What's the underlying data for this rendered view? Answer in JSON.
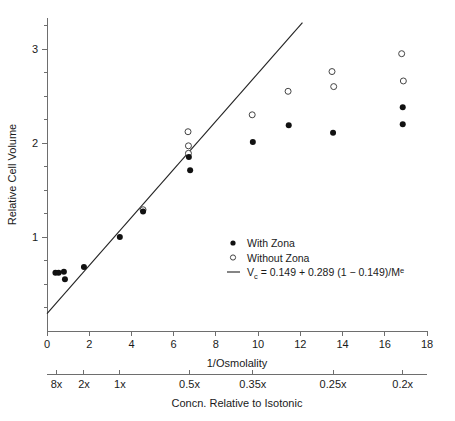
{
  "chart_data": {
    "type": "scatter",
    "title": "",
    "xlabel": "1/Osmolality",
    "ylabel": "Relative Cell Volume",
    "secondary_xlabel": "Concn. Relative to Isotonic",
    "xlim": [
      0,
      18
    ],
    "ylim": [
      0,
      3.45
    ],
    "xticks": [
      0,
      2,
      4,
      6,
      8,
      10,
      12,
      14,
      16,
      18
    ],
    "xticklabels": [
      "0",
      "2",
      "4",
      "6",
      "8",
      "10",
      "12",
      "14",
      "16",
      "18"
    ],
    "yticks": [
      1,
      2,
      3
    ],
    "yticklabels": [
      "1",
      "2",
      "3"
    ],
    "y_minor_ticks": [
      0.25,
      0.5,
      0.75,
      1.25,
      1.5,
      1.75,
      2.25,
      2.5,
      2.75,
      3.25
    ],
    "secondary_xticks": [
      0.45,
      1.75,
      3.45,
      6.75,
      9.75,
      13.55,
      16.85
    ],
    "secondary_xticklabels": [
      "8x",
      "2x",
      "1x",
      "0.5x",
      "0.35x",
      "0.25x",
      "0.2x"
    ],
    "grid": false,
    "legend_position": "center-right",
    "series": [
      {
        "name": "With Zona",
        "marker": "filled-circle",
        "color": "#111111",
        "points": [
          [
            0.4,
            0.62
          ],
          [
            0.55,
            0.62
          ],
          [
            0.8,
            0.63
          ],
          [
            0.85,
            0.55
          ],
          [
            1.75,
            0.68
          ],
          [
            3.45,
            1.0
          ],
          [
            4.55,
            1.27
          ],
          [
            6.72,
            1.85
          ],
          [
            6.78,
            1.71
          ],
          [
            9.75,
            2.01
          ],
          [
            11.45,
            2.19
          ],
          [
            13.55,
            2.11
          ],
          [
            16.85,
            2.38
          ],
          [
            16.85,
            2.2
          ]
        ]
      },
      {
        "name": "Without Zona",
        "marker": "open-circle",
        "color": "#444444",
        "points": [
          [
            4.55,
            1.29
          ],
          [
            6.68,
            2.12
          ],
          [
            6.7,
            1.97
          ],
          [
            6.7,
            1.89
          ],
          [
            9.72,
            2.3
          ],
          [
            11.42,
            2.55
          ],
          [
            13.5,
            2.76
          ],
          [
            13.58,
            2.6
          ],
          [
            16.8,
            2.95
          ],
          [
            16.88,
            2.66
          ]
        ]
      }
    ],
    "fit_line": {
      "label_prefix": "V",
      "label_sub": "c",
      "label_body": " = 0.149 + 0.289 (1 − 0.149)/M",
      "label_sup": "e",
      "equation": "Vc = 0.149 + 0.289 (1 − 0.149)/Mᵉ",
      "x_start": 0.0,
      "y_start": 0.185,
      "x_end": 12.1,
      "y_end": 3.28
    }
  },
  "legend": {
    "items": [
      {
        "label": "With Zona",
        "marker": "filled-circle"
      },
      {
        "label": "Without Zona",
        "marker": "open-circle"
      }
    ]
  }
}
